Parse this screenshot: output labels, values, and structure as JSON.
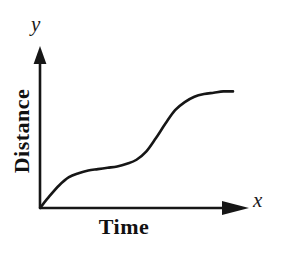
{
  "figure": {
    "background_color": "#ffffff",
    "ink_color": "#161616",
    "width": 284,
    "height": 255
  },
  "axes": {
    "x": {
      "variable_label": "x",
      "title": "Time",
      "arrow": "arrow-right",
      "origin_px": [
        40,
        208
      ],
      "tip_px": [
        248,
        208
      ],
      "line_width": 2.4
    },
    "y": {
      "variable_label": "y",
      "title": "Distance",
      "arrow": "arrow-up",
      "origin_px": [
        40,
        208
      ],
      "tip_px": [
        40,
        48
      ],
      "line_width": 2.4
    }
  },
  "chart_data": {
    "type": "line",
    "title": "",
    "subtitle": "",
    "xlabel": "Time",
    "ylabel": "Distance",
    "x_axis_variable": "x",
    "y_axis_variable": "y",
    "grid": false,
    "legend": null,
    "tick_labels": {
      "x": [],
      "y": []
    },
    "xlim": [
      0,
      1
    ],
    "ylim": [
      0,
      1
    ],
    "annotations": [],
    "series": [
      {
        "name": "distance",
        "line_color": "#161616",
        "line_width": 2.6,
        "x": [
          0.0,
          0.05,
          0.1,
          0.15,
          0.2,
          0.25,
          0.3,
          0.35,
          0.4,
          0.45,
          0.5,
          0.55,
          0.6,
          0.65,
          0.7,
          0.75,
          0.8,
          0.85,
          0.9,
          0.95,
          1.0
        ],
        "y": [
          0.0,
          0.09,
          0.17,
          0.23,
          0.26,
          0.28,
          0.29,
          0.3,
          0.31,
          0.33,
          0.36,
          0.42,
          0.52,
          0.63,
          0.73,
          0.79,
          0.83,
          0.85,
          0.86,
          0.87,
          0.87
        ]
      }
    ]
  }
}
